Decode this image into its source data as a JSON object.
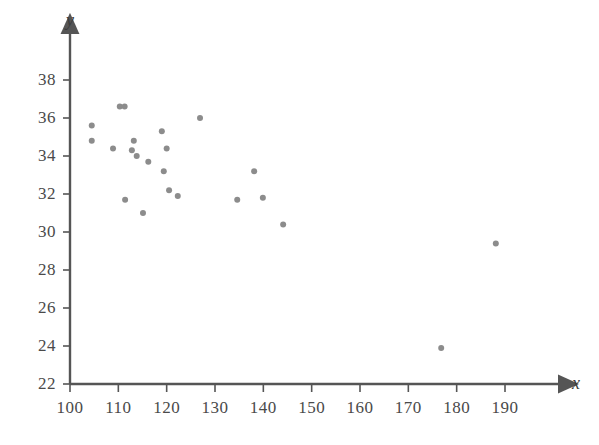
{
  "chart_data": {
    "type": "scatter",
    "title": "",
    "subtitle": "",
    "xlabel": "x",
    "ylabel": "y",
    "xlim": [
      100,
      193
    ],
    "ylim": [
      22,
      39
    ],
    "xticks": [
      100,
      110,
      120,
      130,
      140,
      150,
      160,
      170,
      180,
      190
    ],
    "yticks": [
      22,
      24,
      26,
      28,
      30,
      32,
      34,
      36,
      38
    ],
    "xtick_labels": [
      "100",
      "110",
      "120",
      "130",
      "140",
      "150",
      "160",
      "170",
      "180",
      "190"
    ],
    "ytick_labels": [
      "22",
      "24",
      "26",
      "28",
      "30",
      "32",
      "34",
      "36",
      "38"
    ],
    "grid": false,
    "legend": null,
    "annotations": [],
    "marker": {
      "shape": "circle",
      "color": "#8c8c8c",
      "size": 6
    },
    "axis_color": "#555555",
    "series": [
      {
        "name": "observations",
        "points": [
          [
            104.5,
            35.6
          ],
          [
            104.5,
            34.8
          ],
          [
            108.9,
            34.4
          ],
          [
            110.3,
            36.6
          ],
          [
            111.3,
            36.6
          ],
          [
            111.4,
            31.7
          ],
          [
            112.8,
            34.3
          ],
          [
            113.2,
            34.8
          ],
          [
            113.8,
            34.0
          ],
          [
            115.1,
            31.0
          ],
          [
            116.2,
            33.7
          ],
          [
            119.0,
            35.3
          ],
          [
            119.4,
            33.2
          ],
          [
            120.0,
            34.4
          ],
          [
            120.5,
            32.2
          ],
          [
            122.3,
            31.9
          ],
          [
            126.9,
            36.0
          ],
          [
            134.6,
            31.7
          ],
          [
            138.1,
            33.2
          ],
          [
            139.9,
            31.8
          ],
          [
            144.1,
            30.4
          ],
          [
            176.8,
            23.9
          ],
          [
            188.1,
            29.4
          ]
        ]
      }
    ]
  },
  "axes": {
    "x_name": "x",
    "y_name": "y"
  }
}
